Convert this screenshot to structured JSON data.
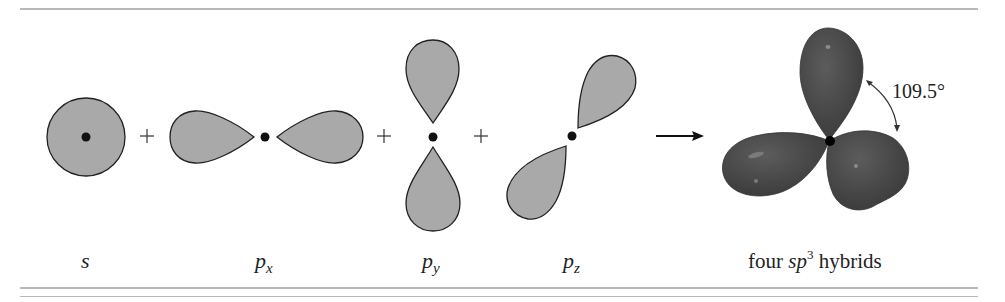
{
  "figure": {
    "orbitals": [
      {
        "id": "s",
        "label": "s",
        "subscript": ""
      },
      {
        "id": "px",
        "label": "p",
        "subscript": "x"
      },
      {
        "id": "py",
        "label": "p",
        "subscript": "y"
      },
      {
        "id": "pz",
        "label": "p",
        "subscript": "z"
      }
    ],
    "operators": [
      "+",
      "+",
      "+"
    ],
    "arrow": "→",
    "result": {
      "prefix": "four ",
      "italic": "sp",
      "superscript": "3",
      "suffix": " hybrids"
    },
    "angle_label": "109.5°",
    "colors": {
      "orbital_fill": "#a9a9a9",
      "orbital_stroke": "#222222",
      "hybrid_fill": "#4a4a4a",
      "rule": "#b8b8b8"
    }
  }
}
